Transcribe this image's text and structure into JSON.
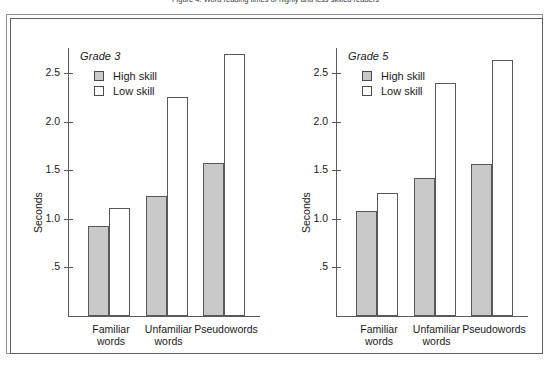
{
  "figure": {
    "caption": "Figure 4.  Word reading times of highly and less skilled readers",
    "frame_color": "#5e5e5e"
  },
  "colors": {
    "high_skill_fill": "#c9c9c9",
    "low_skill_fill": "#ffffff",
    "bar_outline": "#585858",
    "axis": "#5a5a5a"
  },
  "legend": {
    "entries": [
      {
        "label": "High skill",
        "swatch": "high"
      },
      {
        "label": "Low skill",
        "swatch": "low"
      }
    ]
  },
  "axis": {
    "ylabel": "Seconds",
    "yticks": [
      ".5",
      "1.0",
      "1.5",
      "2.0",
      "2.5"
    ],
    "ytick_values": [
      0.5,
      1.0,
      1.5,
      2.0,
      2.5
    ]
  },
  "chart_data": [
    {
      "type": "bar",
      "title": "Grade 3",
      "xlabel": "",
      "ylabel": "Seconds",
      "ylim": [
        0,
        2.9
      ],
      "yticks": [
        0.5,
        1.0,
        1.5,
        2.0,
        2.5
      ],
      "ytick_labels": [
        ".5",
        "1.0",
        "1.5",
        "2.0",
        "2.5"
      ],
      "grid": false,
      "legend_position": "top-left",
      "categories": [
        "Familiar words",
        "Unfamiliar words",
        "Pseudowords"
      ],
      "category_lines": [
        [
          "Familiar",
          "words"
        ],
        [
          "Unfamiliar",
          "words"
        ],
        [
          "Pseudowords",
          ""
        ]
      ],
      "series": [
        {
          "name": "High skill",
          "values": [
            0.93,
            1.23,
            1.57
          ]
        },
        {
          "name": "Low skill",
          "values": [
            1.11,
            2.25,
            2.7
          ]
        }
      ]
    },
    {
      "type": "bar",
      "title": "Grade 5",
      "xlabel": "",
      "ylabel": "Seconds",
      "ylim": [
        0,
        2.9
      ],
      "yticks": [
        0.5,
        1.0,
        1.5,
        2.0,
        2.5
      ],
      "ytick_labels": [
        ".5",
        "1.0",
        "1.5",
        "2.0",
        "2.5"
      ],
      "grid": false,
      "legend_position": "top-left",
      "categories": [
        "Familiar words",
        "Unfamiliar words",
        "Pseudowords"
      ],
      "category_lines": [
        [
          "Familiar",
          "words"
        ],
        [
          "Unfamiliar",
          "words"
        ],
        [
          "Pseudowords",
          ""
        ]
      ],
      "series": [
        {
          "name": "High skill",
          "values": [
            1.08,
            1.42,
            1.56
          ]
        },
        {
          "name": "Low skill",
          "values": [
            1.27,
            2.4,
            2.63
          ]
        }
      ]
    }
  ]
}
